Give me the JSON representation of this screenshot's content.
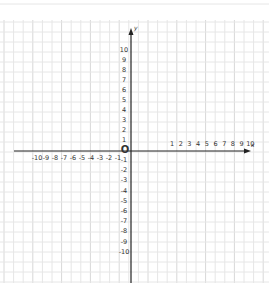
{
  "diagram": {
    "type": "cartesian-coordinate-plane",
    "style": "hand-drawn on graph paper",
    "x_axis": {
      "label": "x",
      "positive_ticks": [
        "1",
        "2",
        "3",
        "4",
        "5",
        "6",
        "7",
        "8",
        "9",
        "10"
      ],
      "negative_ticks": [
        "-10",
        "-9",
        "-8",
        "-7",
        "-6",
        "-5",
        "-4",
        "-3",
        "-2",
        "-1"
      ]
    },
    "y_axis": {
      "label": "y",
      "positive_ticks": [
        "10",
        "9",
        "8",
        "7",
        "6",
        "5",
        "4",
        "3",
        "2",
        "1"
      ],
      "negative_ticks": [
        "-1",
        "-2",
        "-3",
        "-4",
        "-5",
        "-6",
        "-7",
        "-8",
        "-9",
        "-10"
      ]
    },
    "origin_label": "O",
    "colors": {
      "axis": "#222222",
      "grid": "#e6e6e6",
      "grid_strong": "#d8d8d8",
      "text": "#333333",
      "background": "#ffffff"
    }
  }
}
